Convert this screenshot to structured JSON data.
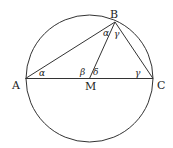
{
  "diagram": {
    "type": "geometry",
    "colors": {
      "stroke": "#333333",
      "text": "#222222",
      "background": "#ffffff"
    },
    "circle": {
      "center": "M",
      "cx": 89.5,
      "cy": 78.5,
      "r": 63.5
    },
    "points": {
      "A": {
        "label": "A",
        "x": 25.5,
        "y": 78.5
      },
      "B": {
        "label": "B",
        "x": 115,
        "y": 22
      },
      "C": {
        "label": "C",
        "x": 153,
        "y": 78.5
      },
      "M": {
        "label": "M",
        "x": 89.5,
        "y": 78.5
      }
    },
    "segments": [
      "AB",
      "BC",
      "AC",
      "BM"
    ],
    "angles": {
      "at_A": "α",
      "at_B_left": "α",
      "at_B_right": "γ",
      "at_M_left": "β",
      "at_M_right": "δ",
      "at_C": "γ"
    }
  }
}
